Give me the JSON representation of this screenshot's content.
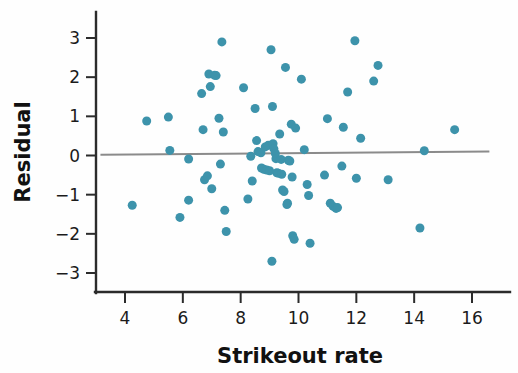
{
  "figure": {
    "title": "",
    "background_color": "#fefefe",
    "point_color": "#3d93ab",
    "line_color": "#8b8b8b",
    "axis_color": "#2b2b2b",
    "text_color": "#1b1b1b"
  },
  "axes": {
    "xlabel": "Strikeout rate",
    "ylabel": "Residual",
    "xticks": [
      "4",
      "6",
      "8",
      "10",
      "12",
      "14",
      "16"
    ],
    "yticks": [
      "3",
      "2",
      "1",
      "0",
      "−1",
      "−2",
      "−3"
    ]
  },
  "chart_data": {
    "type": "scatter",
    "title": "",
    "xlabel": "Strikeout rate",
    "ylabel": "Residual",
    "xlim": [
      3.0,
      16.6
    ],
    "ylim": [
      -3.45,
      3.4
    ],
    "xticks": [
      4,
      6,
      8,
      10,
      12,
      14,
      16
    ],
    "yticks": [
      3,
      2,
      1,
      0,
      -1,
      -2,
      -3
    ],
    "grid": false,
    "legend": null,
    "marker_color": "#3d93ab",
    "marker_size": 9,
    "reference_line": {
      "type": "linear-fit",
      "label": "residual zero / fit line",
      "color": "#8b8b8b",
      "x_start": 3.15,
      "y_start": 0.02,
      "x_end": 16.6,
      "y_end": 0.1
    },
    "points": [
      [
        4.25,
        -1.27
      ],
      [
        4.75,
        0.88
      ],
      [
        5.5,
        0.98
      ],
      [
        5.55,
        0.13
      ],
      [
        5.9,
        -1.58
      ],
      [
        6.2,
        -0.09
      ],
      [
        6.2,
        -1.14
      ],
      [
        6.65,
        1.58
      ],
      [
        6.7,
        0.66
      ],
      [
        6.75,
        -0.62
      ],
      [
        6.85,
        -0.52
      ],
      [
        6.9,
        2.08
      ],
      [
        6.95,
        1.76
      ],
      [
        7.0,
        -0.85
      ],
      [
        7.1,
        2.05
      ],
      [
        7.15,
        2.04
      ],
      [
        7.25,
        0.95
      ],
      [
        7.3,
        -0.22
      ],
      [
        7.35,
        2.9
      ],
      [
        7.4,
        0.6
      ],
      [
        7.45,
        -1.4
      ],
      [
        7.5,
        -1.94
      ],
      [
        8.1,
        1.73
      ],
      [
        8.25,
        -1.11
      ],
      [
        8.35,
        -0.02
      ],
      [
        8.4,
        -0.65
      ],
      [
        8.5,
        1.2
      ],
      [
        8.55,
        0.38
      ],
      [
        8.6,
        0.1
      ],
      [
        8.7,
        0.07
      ],
      [
        8.72,
        -0.32
      ],
      [
        8.8,
        -0.35
      ],
      [
        8.85,
        0.22
      ],
      [
        8.9,
        -0.37
      ],
      [
        8.95,
        0.26
      ],
      [
        9.0,
        -0.39
      ],
      [
        9.05,
        2.7
      ],
      [
        9.08,
        -2.7
      ],
      [
        9.1,
        1.25
      ],
      [
        9.12,
        0.3
      ],
      [
        9.15,
        0.17
      ],
      [
        9.2,
        0.05
      ],
      [
        9.22,
        -0.08
      ],
      [
        9.25,
        -0.44
      ],
      [
        9.3,
        -0.45
      ],
      [
        9.35,
        0.55
      ],
      [
        9.4,
        -0.1
      ],
      [
        9.42,
        -0.48
      ],
      [
        9.45,
        -0.88
      ],
      [
        9.5,
        -0.92
      ],
      [
        9.55,
        2.25
      ],
      [
        9.6,
        -1.25
      ],
      [
        9.62,
        -1.22
      ],
      [
        9.65,
        -0.12
      ],
      [
        9.7,
        -0.14
      ],
      [
        9.75,
        0.8
      ],
      [
        9.78,
        -0.55
      ],
      [
        9.8,
        -2.05
      ],
      [
        9.85,
        -2.14
      ],
      [
        9.9,
        0.7
      ],
      [
        10.1,
        1.95
      ],
      [
        10.2,
        0.15
      ],
      [
        10.3,
        -0.74
      ],
      [
        10.35,
        -1.02
      ],
      [
        10.4,
        -2.24
      ],
      [
        10.9,
        -0.5
      ],
      [
        11.0,
        0.94
      ],
      [
        11.1,
        -1.22
      ],
      [
        11.2,
        -1.3
      ],
      [
        11.3,
        -1.35
      ],
      [
        11.35,
        -1.33
      ],
      [
        11.5,
        -0.27
      ],
      [
        11.55,
        0.72
      ],
      [
        11.7,
        1.62
      ],
      [
        11.95,
        2.93
      ],
      [
        12.0,
        -0.58
      ],
      [
        12.15,
        0.44
      ],
      [
        12.6,
        1.9
      ],
      [
        12.75,
        2.3
      ],
      [
        13.1,
        -0.62
      ],
      [
        14.2,
        -1.85
      ],
      [
        14.35,
        0.12
      ],
      [
        15.4,
        0.66
      ]
    ]
  }
}
